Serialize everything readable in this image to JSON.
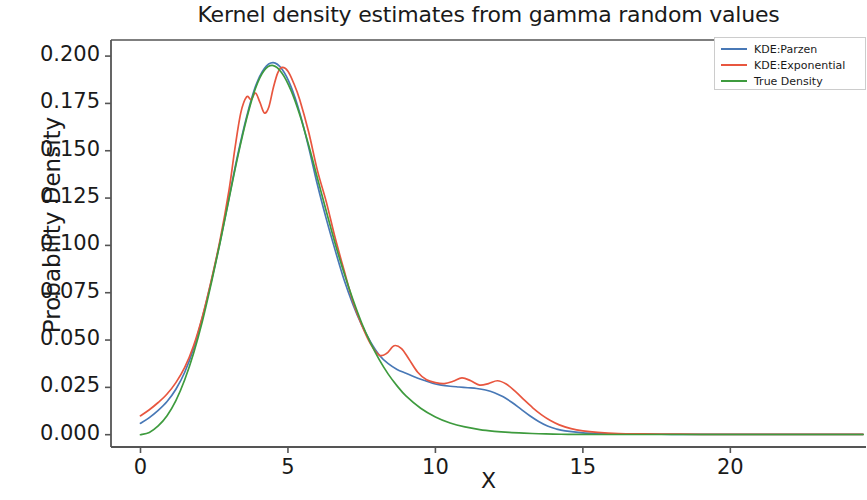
{
  "chart_data": {
    "type": "line",
    "title": "Kernel density estimates from gamma random values",
    "xlabel": "X",
    "ylabel": "Probability Density",
    "xlim": [
      -1.0,
      24.6
    ],
    "ylim": [
      -0.0065,
      0.2085
    ],
    "xticks": [
      0,
      5,
      10,
      15,
      20
    ],
    "xtick_labels": [
      "0",
      "5",
      "10",
      "15",
      "20"
    ],
    "yticks": [
      0.0,
      0.025,
      0.05,
      0.075,
      0.1,
      0.125,
      0.15,
      0.175,
      0.2
    ],
    "ytick_labels": [
      "0.000",
      "0.025",
      "0.050",
      "0.075",
      "0.100",
      "0.125",
      "0.150",
      "0.175",
      "0.200"
    ],
    "grid": false,
    "legend_position": "upper right",
    "colors": {
      "kde_parzen": "#4878b6",
      "kde_exponential": "#e8563f",
      "true_density": "#3e9b3e",
      "axis": "#444444",
      "text": "#1a1a1a"
    },
    "series": [
      {
        "name": "KDE:Parzen",
        "color": "#4878b6",
        "x": [
          0.0,
          0.3,
          0.6,
          0.9,
          1.2,
          1.5,
          1.8,
          2.1,
          2.4,
          2.7,
          3.0,
          3.3,
          3.6,
          3.9,
          4.2,
          4.5,
          4.8,
          5.1,
          5.4,
          5.7,
          6.0,
          6.3,
          6.6,
          6.9,
          7.2,
          7.5,
          7.8,
          8.1,
          8.4,
          8.7,
          9.0,
          9.3,
          9.6,
          9.9,
          10.2,
          10.5,
          10.8,
          11.1,
          11.4,
          11.7,
          12.0,
          12.3,
          12.6,
          12.9,
          13.2,
          13.5,
          13.8,
          14.1,
          14.4,
          15.0,
          15.6,
          16.2,
          17.0,
          18.0,
          19.0,
          20.0,
          21.5,
          23.0,
          24.5
        ],
        "y": [
          0.006,
          0.009,
          0.0128,
          0.0175,
          0.024,
          0.033,
          0.0455,
          0.062,
          0.081,
          0.102,
          0.125,
          0.148,
          0.168,
          0.184,
          0.1935,
          0.1965,
          0.193,
          0.184,
          0.17,
          0.152,
          0.132,
          0.114,
          0.0975,
          0.082,
          0.069,
          0.058,
          0.049,
          0.042,
          0.0375,
          0.0345,
          0.0325,
          0.0305,
          0.0288,
          0.0272,
          0.0262,
          0.0256,
          0.0252,
          0.0248,
          0.0244,
          0.0236,
          0.0222,
          0.02,
          0.017,
          0.0135,
          0.01,
          0.007,
          0.0046,
          0.003,
          0.002,
          0.001,
          0.0006,
          0.0004,
          0.0003,
          0.0002,
          0.0002,
          0.0002,
          0.0002,
          0.0002,
          0.0002
        ]
      },
      {
        "name": "KDE:Exponential",
        "color": "#e8563f",
        "x": [
          0.0,
          0.3,
          0.6,
          0.9,
          1.2,
          1.5,
          1.8,
          2.1,
          2.4,
          2.7,
          3.0,
          3.2,
          3.4,
          3.6,
          3.75,
          3.9,
          4.05,
          4.2,
          4.35,
          4.5,
          4.65,
          4.8,
          5.0,
          5.2,
          5.4,
          5.7,
          6.0,
          6.3,
          6.6,
          6.9,
          7.2,
          7.5,
          7.8,
          8.1,
          8.35,
          8.6,
          8.85,
          9.1,
          9.4,
          9.7,
          10.0,
          10.3,
          10.6,
          10.9,
          11.2,
          11.5,
          11.8,
          12.1,
          12.4,
          12.7,
          13.0,
          13.3,
          13.6,
          13.9,
          14.2,
          14.6,
          15.0,
          15.5,
          16.2,
          17.0,
          18.0,
          19.0,
          20.0,
          21.5,
          23.0,
          24.5
        ],
        "y": [
          0.01,
          0.0132,
          0.017,
          0.0215,
          0.0275,
          0.0355,
          0.047,
          0.0625,
          0.0815,
          0.103,
          0.129,
          0.151,
          0.17,
          0.1785,
          0.177,
          0.1805,
          0.1755,
          0.17,
          0.173,
          0.183,
          0.191,
          0.194,
          0.192,
          0.1855,
          0.177,
          0.16,
          0.1395,
          0.123,
          0.104,
          0.087,
          0.0705,
          0.058,
          0.048,
          0.042,
          0.043,
          0.047,
          0.0455,
          0.04,
          0.033,
          0.029,
          0.0275,
          0.027,
          0.0282,
          0.03,
          0.0285,
          0.0262,
          0.027,
          0.0285,
          0.0268,
          0.023,
          0.0185,
          0.0142,
          0.0105,
          0.0075,
          0.0052,
          0.0032,
          0.002,
          0.0012,
          0.0006,
          0.0004,
          0.0003,
          0.0002,
          0.0002,
          0.0002,
          0.0002,
          0.0002
        ]
      },
      {
        "name": "True Density",
        "color": "#3e9b3e",
        "x": [
          0.0,
          0.3,
          0.6,
          0.9,
          1.2,
          1.5,
          1.8,
          2.1,
          2.4,
          2.7,
          3.0,
          3.3,
          3.6,
          3.9,
          4.2,
          4.5,
          4.8,
          5.1,
          5.4,
          5.7,
          6.0,
          6.3,
          6.6,
          6.9,
          7.2,
          7.5,
          7.8,
          8.1,
          8.4,
          8.7,
          9.0,
          9.5,
          10.0,
          10.5,
          11.0,
          11.5,
          12.0,
          12.5,
          13.0,
          13.5,
          14.0,
          14.5,
          15.0,
          15.5,
          16.0,
          17.0,
          18.0,
          19.0,
          20.0,
          21.5,
          23.0,
          24.5
        ],
        "y": [
          0.0,
          0.0012,
          0.0046,
          0.01,
          0.018,
          0.029,
          0.043,
          0.06,
          0.08,
          0.1015,
          0.1245,
          0.147,
          0.167,
          0.183,
          0.1925,
          0.195,
          0.191,
          0.182,
          0.169,
          0.153,
          0.1355,
          0.118,
          0.101,
          0.0855,
          0.0715,
          0.059,
          0.0485,
          0.0395,
          0.032,
          0.0258,
          0.0205,
          0.014,
          0.0094,
          0.0062,
          0.0041,
          0.0027,
          0.0018,
          0.0012,
          0.0008,
          0.0005,
          0.0003,
          0.0002,
          0.0002,
          0.0001,
          0.0001,
          0.0001,
          0.0001,
          0.0001,
          0.0001,
          0.0001,
          0.0001,
          0.0001
        ]
      }
    ],
    "legend": [
      {
        "label": "KDE:Parzen",
        "color": "#4878b6"
      },
      {
        "label": "KDE:Exponential",
        "color": "#e8563f"
      },
      {
        "label": "True Density",
        "color": "#3e9b3e"
      }
    ]
  }
}
